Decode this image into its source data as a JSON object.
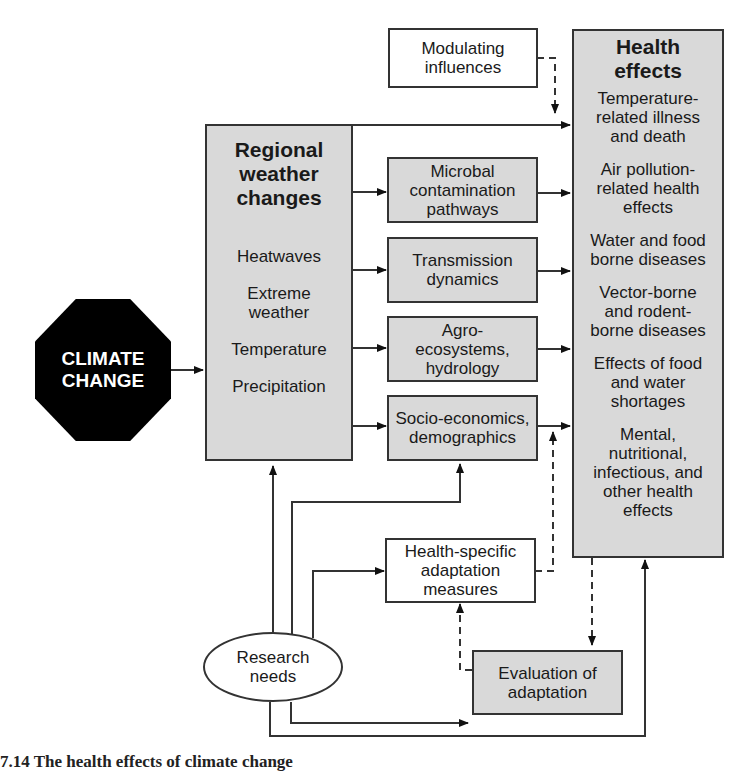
{
  "diagram": {
    "source": {
      "label_line1": "CLIMATE",
      "label_line2": "CHANGE"
    },
    "regional": {
      "title_lines": [
        "Regional",
        "weather",
        "changes"
      ],
      "items": [
        "Heatwaves",
        "Extreme weather",
        "Temperature",
        "Precipitation"
      ],
      "items_lines": [
        [
          "Heatwaves"
        ],
        [
          "Extreme",
          "weather"
        ],
        [
          "Temperature"
        ],
        [
          "Precipitation"
        ]
      ]
    },
    "pathways": [
      {
        "lines": [
          "Microbal",
          "contamination",
          "pathways"
        ]
      },
      {
        "lines": [
          "Transmission",
          "dynamics"
        ]
      },
      {
        "lines": [
          "Agro-",
          "ecosystems,",
          "hydrology"
        ]
      },
      {
        "lines": [
          "Socio-economics,",
          "demographics"
        ]
      }
    ],
    "modulating": {
      "lines": [
        "Modulating",
        "influences"
      ]
    },
    "health_effects": {
      "title_lines": [
        "Health",
        "effects"
      ],
      "items": [
        {
          "lines": [
            "Temperature-",
            "related illness",
            "and death"
          ]
        },
        {
          "lines": [
            "Air pollution-",
            "related health",
            "effects"
          ]
        },
        {
          "lines": [
            "Water and food",
            "borne diseases"
          ]
        },
        {
          "lines": [
            "Vector-borne",
            "and rodent-",
            "borne diseases"
          ]
        },
        {
          "lines": [
            "Effects of food",
            "and water",
            "shortages"
          ]
        },
        {
          "lines": [
            "Mental,",
            "nutritional,",
            "infectious, and",
            "other health",
            "effects"
          ]
        }
      ]
    },
    "adaptation": {
      "lines": [
        "Health-specific",
        "adaptation",
        "measures"
      ]
    },
    "evaluation": {
      "lines": [
        "Evaluation of",
        "adaptation"
      ]
    },
    "research": {
      "lines": [
        "Research",
        "needs"
      ]
    }
  },
  "caption": "7.14  The health effects of climate change",
  "colors": {
    "box_fill": "#d9d9d9",
    "line": "#333333",
    "octagon": "#000000"
  }
}
